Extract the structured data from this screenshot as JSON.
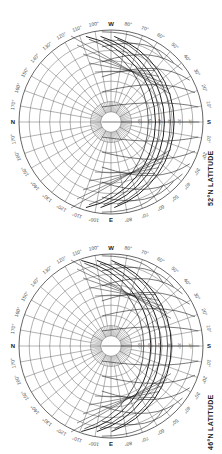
{
  "orientation": "rotated-90-clockwise",
  "diagrams": [
    {
      "id": "52N",
      "title": "52°N LATITUDE",
      "center": [
        111,
        122
      ],
      "radius": 92,
      "compass": {
        "top": "W",
        "bottom": "E",
        "left": "N",
        "right": "S"
      },
      "azimuth_labels": [
        "10°",
        "20°",
        "30°",
        "40°",
        "50°",
        "60°",
        "70°",
        "80°",
        "100°",
        "110°",
        "120°",
        "130°",
        "140°",
        "150°",
        "160°",
        "170°"
      ],
      "altitude_labels": [
        "10°",
        "20°",
        "30°",
        "40°",
        "50°",
        "60°"
      ],
      "month_curve_offsets": [
        0.35,
        0.52,
        0.68
      ]
    },
    {
      "id": "46N",
      "title": "46°N LATITUDE",
      "center": [
        111,
        346
      ],
      "radius": 92,
      "compass": {
        "top": "W",
        "bottom": "E",
        "left": "N",
        "right": "S"
      },
      "azimuth_labels": [
        "10°",
        "20°",
        "30°",
        "40°",
        "50°",
        "60°",
        "70°",
        "80°",
        "100°",
        "110°",
        "120°",
        "130°",
        "140°",
        "150°",
        "160°",
        "170°"
      ],
      "altitude_labels": [
        "10°",
        "20°",
        "30°",
        "40°",
        "50°",
        "60°"
      ],
      "month_curve_offsets": [
        0.3,
        0.48,
        0.65
      ]
    }
  ],
  "colors": {
    "line": "#555555",
    "heavy": "#222222",
    "paper": "#ffffff"
  }
}
